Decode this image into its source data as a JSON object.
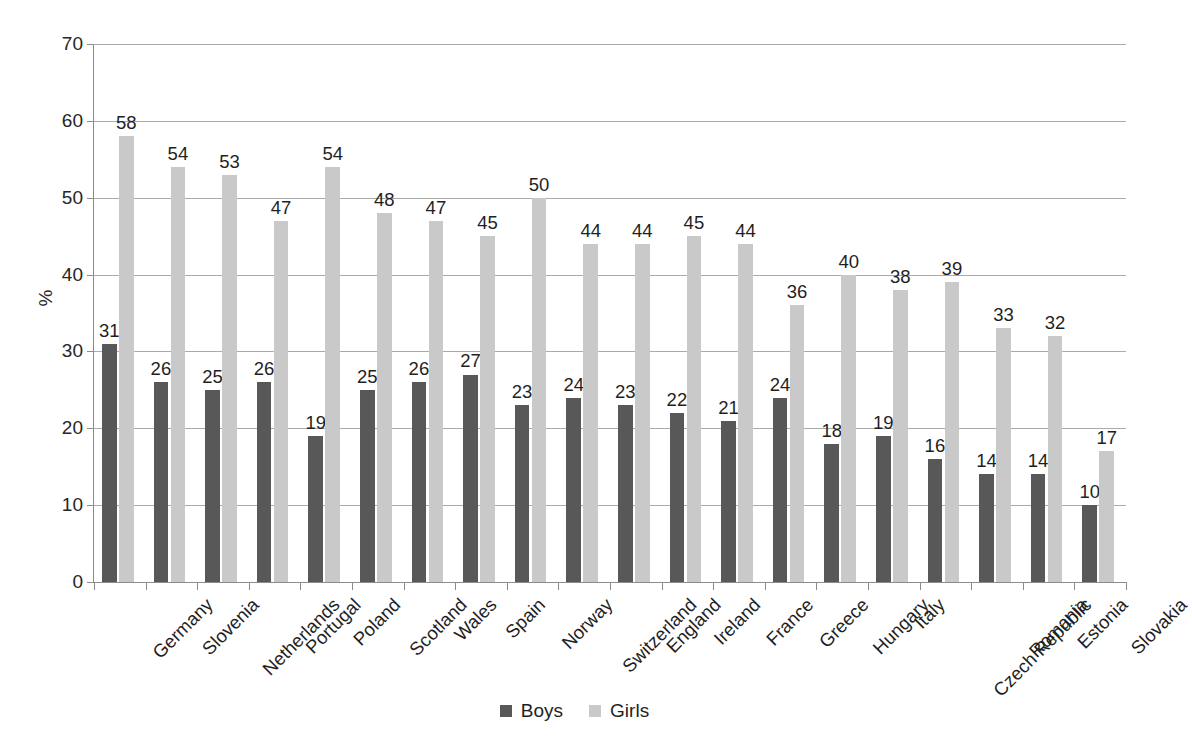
{
  "chart_data": {
    "type": "bar",
    "title": "",
    "subtitle": "",
    "xlabel": "",
    "ylabel": "%",
    "ylim": [
      0,
      70
    ],
    "ytick_step": 10,
    "yticks": [
      0,
      10,
      20,
      30,
      40,
      50,
      60,
      70
    ],
    "ytick_labels": [
      "0",
      "10",
      "20",
      "30",
      "40",
      "50",
      "60",
      "70"
    ],
    "grid": "horizontal",
    "legend_position": "bottom-center",
    "data_labels": true,
    "categories": [
      "Germany",
      "Slovenia",
      "Netherlands",
      "Portugal",
      "Poland",
      "Scotland",
      "Wales",
      "Spain",
      "Norway",
      "Switzerland",
      "England",
      "Ireland",
      "France",
      "Greece",
      "Hungary",
      "Italy",
      "Czech Republic",
      "Romania",
      "Estonia",
      "Slovakia"
    ],
    "series": [
      {
        "name": "Boys",
        "color": "#585858",
        "values": [
          31,
          26,
          25,
          26,
          19,
          25,
          26,
          27,
          23,
          24,
          23,
          22,
          21,
          24,
          18,
          19,
          16,
          14,
          14,
          10
        ]
      },
      {
        "name": "Girls",
        "color": "#c9c9c9",
        "values": [
          58,
          54,
          53,
          47,
          54,
          48,
          47,
          45,
          50,
          44,
          44,
          45,
          44,
          36,
          40,
          38,
          39,
          33,
          32,
          17
        ]
      }
    ]
  },
  "legend": {
    "entries": [
      {
        "label": "Boys",
        "color": "#585858"
      },
      {
        "label": "Girls",
        "color": "#c9c9c9"
      }
    ]
  },
  "axis": {
    "y_title": "%"
  }
}
